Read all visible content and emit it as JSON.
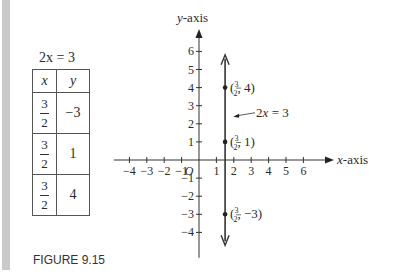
{
  "figure_caption": "FIGURE 9.15",
  "table": {
    "title": "2x = 3",
    "headers": [
      "x",
      "y"
    ],
    "rows": [
      {
        "x_num": "3",
        "x_den": "2",
        "y": "−3"
      },
      {
        "x_num": "3",
        "x_den": "2",
        "y": "1"
      },
      {
        "x_num": "3",
        "x_den": "2",
        "y": "4"
      }
    ]
  },
  "chart_data": {
    "type": "line",
    "title": "",
    "xlabel": "x-axis",
    "ylabel": "y-axis",
    "xlim": [
      -4,
      6
    ],
    "ylim": [
      -4,
      6
    ],
    "x_ticks": [
      -4,
      -3,
      -2,
      -1,
      1,
      2,
      3,
      4,
      5,
      6
    ],
    "y_ticks": [
      -4,
      -3,
      -2,
      -1,
      1,
      2,
      3,
      4,
      5,
      6
    ],
    "x_tick_labels": [
      "−4",
      "−3",
      "−2",
      "−1",
      "1",
      "2",
      "3",
      "4",
      "5",
      "6"
    ],
    "y_tick_labels": [
      "−4",
      "−3",
      "−2",
      "−1",
      "1",
      "2",
      "3",
      "4",
      "5",
      "6"
    ],
    "origin_label": "O",
    "grid": false,
    "line": {
      "equation": "2x = 3",
      "x": 1.5,
      "y_range": [
        -4.6,
        5.7
      ]
    },
    "points": [
      {
        "x": 1.5,
        "y": 4,
        "label": "(3/2, 4)",
        "label_y": "4"
      },
      {
        "x": 1.5,
        "y": 1,
        "label": "(3/2, 1)",
        "label_y": "1"
      },
      {
        "x": 1.5,
        "y": -3,
        "label": "(3/2, −3)",
        "label_y": "−3"
      }
    ],
    "annotation": {
      "text": "2x = 3",
      "at_y": 2.5
    }
  }
}
